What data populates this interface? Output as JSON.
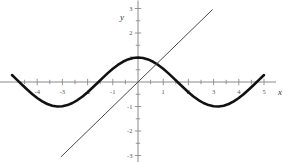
{
  "chart_data": {
    "type": "line",
    "title": "",
    "subtitle": "",
    "xlabel": "x",
    "ylabel": "y",
    "xlim": [
      -5,
      5
    ],
    "ylim": [
      -3,
      3
    ],
    "grid": false,
    "legend": "none",
    "x_tick_labels": [
      "-4",
      "-3",
      "-2",
      "-1",
      "1",
      "2",
      "3",
      "4",
      "5"
    ],
    "x_tick_values": [
      -4,
      -3,
      -2,
      -1,
      1,
      2,
      3,
      4,
      5
    ],
    "x_minor_ticks": [
      -4.5,
      -3.5,
      -2.5,
      -1.5,
      -0.5,
      0.5,
      1.5,
      2.5,
      3.5,
      4.5
    ],
    "y_tick_labels": [
      "3",
      "2",
      "1",
      "-1",
      "-2",
      "-3"
    ],
    "y_tick_values": [
      3,
      2,
      1,
      -1,
      -2,
      -3
    ],
    "y_minor_ticks": [
      2.5,
      1.5,
      0.5,
      -0.5,
      -1.5,
      -2.5
    ],
    "series": [
      {
        "name": "cosine-curve",
        "expression": "y = cos(x)",
        "style": "thick-solid",
        "color": "#111111",
        "width": 2.6,
        "x": [
          -5.0,
          -4.8,
          -4.6,
          -4.4,
          -4.2,
          -4.0,
          -3.8,
          -3.6,
          -3.4,
          -3.2,
          -3.0,
          -2.8,
          -2.6,
          -2.4,
          -2.2,
          -2.0,
          -1.8,
          -1.6,
          -1.4,
          -1.2,
          -1.0,
          -0.8,
          -0.6,
          -0.4,
          -0.2,
          0.0,
          0.2,
          0.4,
          0.6,
          0.8,
          1.0,
          1.2,
          1.4,
          1.6,
          1.8,
          2.0,
          2.2,
          2.4,
          2.6,
          2.8,
          3.0,
          3.2,
          3.4,
          3.6,
          3.8,
          4.0,
          4.2,
          4.4,
          4.6,
          4.8,
          5.0
        ],
        "values": [
          0.284,
          0.087,
          -0.112,
          -0.307,
          -0.49,
          -0.654,
          -0.791,
          -0.897,
          -0.967,
          -0.998,
          -0.99,
          -0.942,
          -0.857,
          -0.737,
          -0.589,
          -0.416,
          -0.227,
          -0.029,
          0.17,
          0.362,
          0.54,
          0.697,
          0.825,
          0.921,
          0.98,
          1.0,
          0.98,
          0.921,
          0.825,
          0.697,
          0.54,
          0.362,
          0.17,
          -0.029,
          -0.227,
          -0.416,
          -0.589,
          -0.737,
          -0.857,
          -0.942,
          -0.99,
          -0.998,
          -0.967,
          -0.897,
          -0.791,
          -0.654,
          -0.49,
          -0.307,
          -0.112,
          0.087,
          0.284
        ]
      },
      {
        "name": "identity-line",
        "expression": "y = x",
        "style": "thin-solid",
        "color": "#4a4a4a",
        "width": 1.0,
        "x": [
          -3.05,
          2.95
        ],
        "values": [
          -3.05,
          2.95
        ]
      }
    ],
    "annotations": []
  },
  "figure": {
    "axis_color": "#8a8a8a",
    "tick_color": "#8a8a8a",
    "background": "#ffffff"
  }
}
